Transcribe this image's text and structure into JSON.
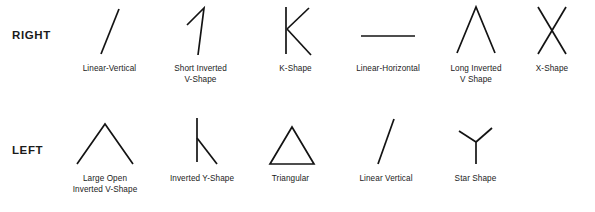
{
  "figure": {
    "background_color": "#ffffff",
    "stroke_color": "#131313",
    "text_color": "#1b1b1b"
  },
  "rows": [
    {
      "label": "RIGHT",
      "items": [
        {
          "caption": "Linear-Vertical",
          "shape": "slanted-line"
        },
        {
          "caption": "Short Inverted\nV-Shape",
          "shape": "short-inverted-v"
        },
        {
          "caption": "K-Shape",
          "shape": "k-shape"
        },
        {
          "caption": "Linear-Horizontal",
          "shape": "horizontal-line"
        },
        {
          "caption": "Long Inverted\nV Shape",
          "shape": "long-inverted-v"
        },
        {
          "caption": "X-Shape",
          "shape": "x-shape"
        }
      ]
    },
    {
      "label": "LEFT",
      "items": [
        {
          "caption": "Large Open\nInverted V-Shape",
          "shape": "large-open-inverted-v"
        },
        {
          "caption": "Inverted Y-Shape",
          "shape": "inverted-y-shape"
        },
        {
          "caption": "Triangular",
          "shape": "triangle"
        },
        {
          "caption": "Linear Vertical",
          "shape": "slanted-line"
        },
        {
          "caption": "Star Shape",
          "shape": "star-shape"
        }
      ]
    }
  ]
}
